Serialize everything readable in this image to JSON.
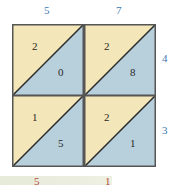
{
  "top_labels": [
    "5",
    "7"
  ],
  "right_labels": [
    "4",
    "3"
  ],
  "cells": [
    {
      "upper": "2",
      "lower": "0"
    },
    {
      "upper": "2",
      "lower": "8"
    },
    {
      "upper": "1",
      "lower": "5"
    },
    {
      "upper": "2",
      "lower": "1"
    }
  ],
  "result_digits": [
    "5",
    "1"
  ],
  "colors": {
    "upper": "#f3e6b8",
    "lower": "#b8cfdc",
    "border": "#2a2a2a",
    "label": "#3a78b0",
    "result": "#b84a3a"
  }
}
